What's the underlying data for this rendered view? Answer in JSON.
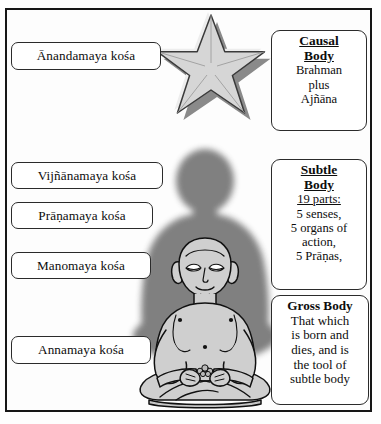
{
  "page": {
    "background_color": "#fefefe",
    "frame_color": "#161616"
  },
  "kosas": [
    {
      "id": "anandamaya",
      "label": "Ānandamaya kośa"
    },
    {
      "id": "vijnanamaya",
      "label": "Vijñānamaya kośa"
    },
    {
      "id": "pranamaya",
      "label": "Prāṇamaya kośa"
    },
    {
      "id": "manomaya",
      "label": "Manomaya kośa"
    },
    {
      "id": "annamaya",
      "label": "Annamaya kośa"
    }
  ],
  "bodies": {
    "causal": {
      "title_line1": "Causal",
      "title_line2": "Body",
      "lines": [
        "Brahman",
        "plus",
        "Ajñāna"
      ]
    },
    "subtle": {
      "title_line1": "Subtle",
      "title_line2": "Body",
      "subtitle": "19 parts:",
      "lines": [
        "5 senses,",
        "5 organs of",
        "action,",
        "5 Prāṇas,"
      ]
    },
    "gross": {
      "title_line1": "Gross Body",
      "lines": [
        "That which",
        "is born and",
        "dies, and is",
        "the tool of",
        "subtle body"
      ]
    }
  },
  "artwork": {
    "star": {
      "name": "five-pointed-star",
      "face_color": "#d9d9d9",
      "bevel_light": "#efefef",
      "bevel_dark": "#8e8e8e",
      "outline_color": "#3a3a3a"
    },
    "aura": {
      "name": "dark-silhouette-aura",
      "color": "#7c7c7c"
    },
    "figure": {
      "name": "meditating-figure",
      "fill_color": "#cfcfcf",
      "outline_color": "#111111"
    }
  }
}
